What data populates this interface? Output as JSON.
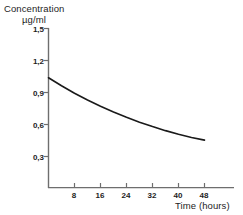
{
  "chart_data": {
    "type": "line",
    "title": "",
    "ylabel_line1": "Concentration",
    "ylabel_line2": "µg/ml",
    "xlabel": "Time (hours)",
    "xlim": [
      0,
      52
    ],
    "ylim": [
      0,
      1.5
    ],
    "grid": false,
    "legend": "none",
    "x_ticks": [
      {
        "value": 8,
        "label": "8"
      },
      {
        "value": 16,
        "label": "16"
      },
      {
        "value": 24,
        "label": "24"
      },
      {
        "value": 32,
        "label": "32"
      },
      {
        "value": 40,
        "label": "40"
      },
      {
        "value": 48,
        "label": "48"
      }
    ],
    "y_ticks": [
      {
        "value": 1.5,
        "label": "1,5"
      },
      {
        "value": 1.2,
        "label": "1,2"
      },
      {
        "value": 0.9,
        "label": "0,9"
      },
      {
        "value": 0.6,
        "label": "0,6"
      },
      {
        "value": 0.3,
        "label": "0,3"
      }
    ],
    "series": [
      {
        "name": "Concentration",
        "color": "#1a1a1a",
        "x": [
          0,
          4,
          8,
          12,
          16,
          20,
          24,
          28,
          32,
          36,
          40,
          44,
          48
        ],
        "y": [
          1.03,
          0.955,
          0.885,
          0.822,
          0.763,
          0.709,
          0.659,
          0.613,
          0.572,
          0.534,
          0.5,
          0.47,
          0.445
        ]
      }
    ]
  },
  "axis": {
    "line_color": "#6e6e6e",
    "curve_color": "#1a1a1a"
  }
}
